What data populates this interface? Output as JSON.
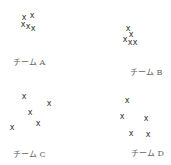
{
  "panels": [
    {
      "label": "チーム A",
      "label_pos": [
        13,
        58
      ],
      "marks": [
        [
          24,
          18
        ],
        [
          32,
          16
        ],
        [
          23,
          25
        ],
        [
          28,
          27
        ],
        [
          33,
          29
        ]
      ]
    },
    {
      "label": "チーム B",
      "label_pos": [
        130,
        68
      ],
      "marks": [
        [
          128,
          29
        ],
        [
          131,
          35
        ],
        [
          125,
          40
        ],
        [
          130,
          43
        ],
        [
          135,
          43
        ]
      ]
    },
    {
      "label": "チーム C",
      "label_pos": [
        13,
        150
      ],
      "marks": [
        [
          24,
          97
        ],
        [
          49,
          104
        ],
        [
          30,
          113
        ],
        [
          38,
          124
        ],
        [
          12,
          128
        ]
      ]
    },
    {
      "label": "チーム D",
      "label_pos": [
        131,
        149
      ],
      "marks": [
        [
          127,
          101
        ],
        [
          122,
          117
        ],
        [
          146,
          119
        ],
        [
          131,
          134
        ],
        [
          148,
          135
        ]
      ]
    }
  ],
  "mark_glyph": "x"
}
